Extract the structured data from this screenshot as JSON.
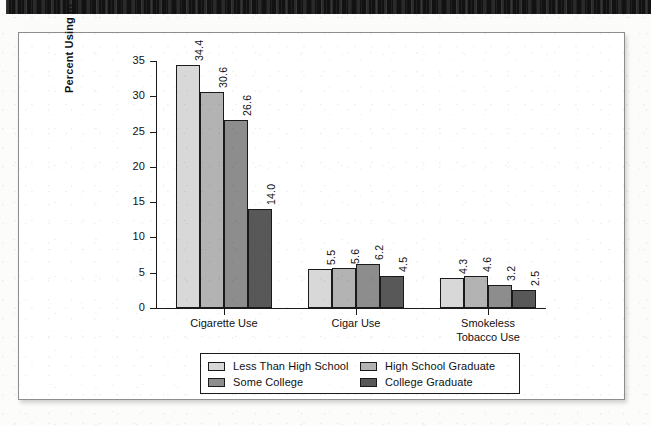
{
  "figure": {
    "frame_border_color": "#8e8e8e",
    "background_color": "#ffffff"
  },
  "scan": {
    "top_bar_color": "#121212"
  },
  "chart_data": {
    "type": "bar",
    "title": "",
    "xlabel": "",
    "ylabel": "Percent Using in Past Month",
    "ylim": [
      0,
      35
    ],
    "yticks": [
      0,
      5,
      10,
      15,
      20,
      25,
      30,
      35
    ],
    "ytick_labels": [
      "0",
      "5",
      "10",
      "15",
      "20",
      "25",
      "30",
      "35"
    ],
    "grid": false,
    "legend_position": "below-axes",
    "categories": [
      "Cigarette Use",
      "Cigar Use",
      "Smokeless\nTobacco Use"
    ],
    "series": [
      {
        "name": "Less Than High School",
        "color": "#d8d8d8",
        "values": [
          34.4,
          5.5,
          4.3
        ],
        "labels": [
          "34.4",
          "5.5",
          "4.3"
        ]
      },
      {
        "name": "High School Graduate",
        "color": "#b3b3b3",
        "values": [
          30.6,
          5.6,
          4.6
        ],
        "labels": [
          "30.6",
          "5.6",
          "4.6"
        ]
      },
      {
        "name": "Some College",
        "color": "#8d8d8d",
        "values": [
          26.6,
          6.2,
          3.2
        ],
        "labels": [
          "26.6",
          "6.2",
          "3.2"
        ]
      },
      {
        "name": "College Graduate",
        "color": "#585858",
        "values": [
          14.0,
          4.5,
          2.5
        ],
        "labels": [
          "14.0",
          "4.5",
          "2.5"
        ]
      }
    ]
  },
  "legend": {
    "entries": [
      {
        "label": "Less Than High School",
        "color": "#d8d8d8"
      },
      {
        "label": "High School Graduate",
        "color": "#b3b3b3"
      },
      {
        "label": "Some College",
        "color": "#8d8d8d"
      },
      {
        "label": "College Graduate",
        "color": "#585858"
      }
    ]
  }
}
